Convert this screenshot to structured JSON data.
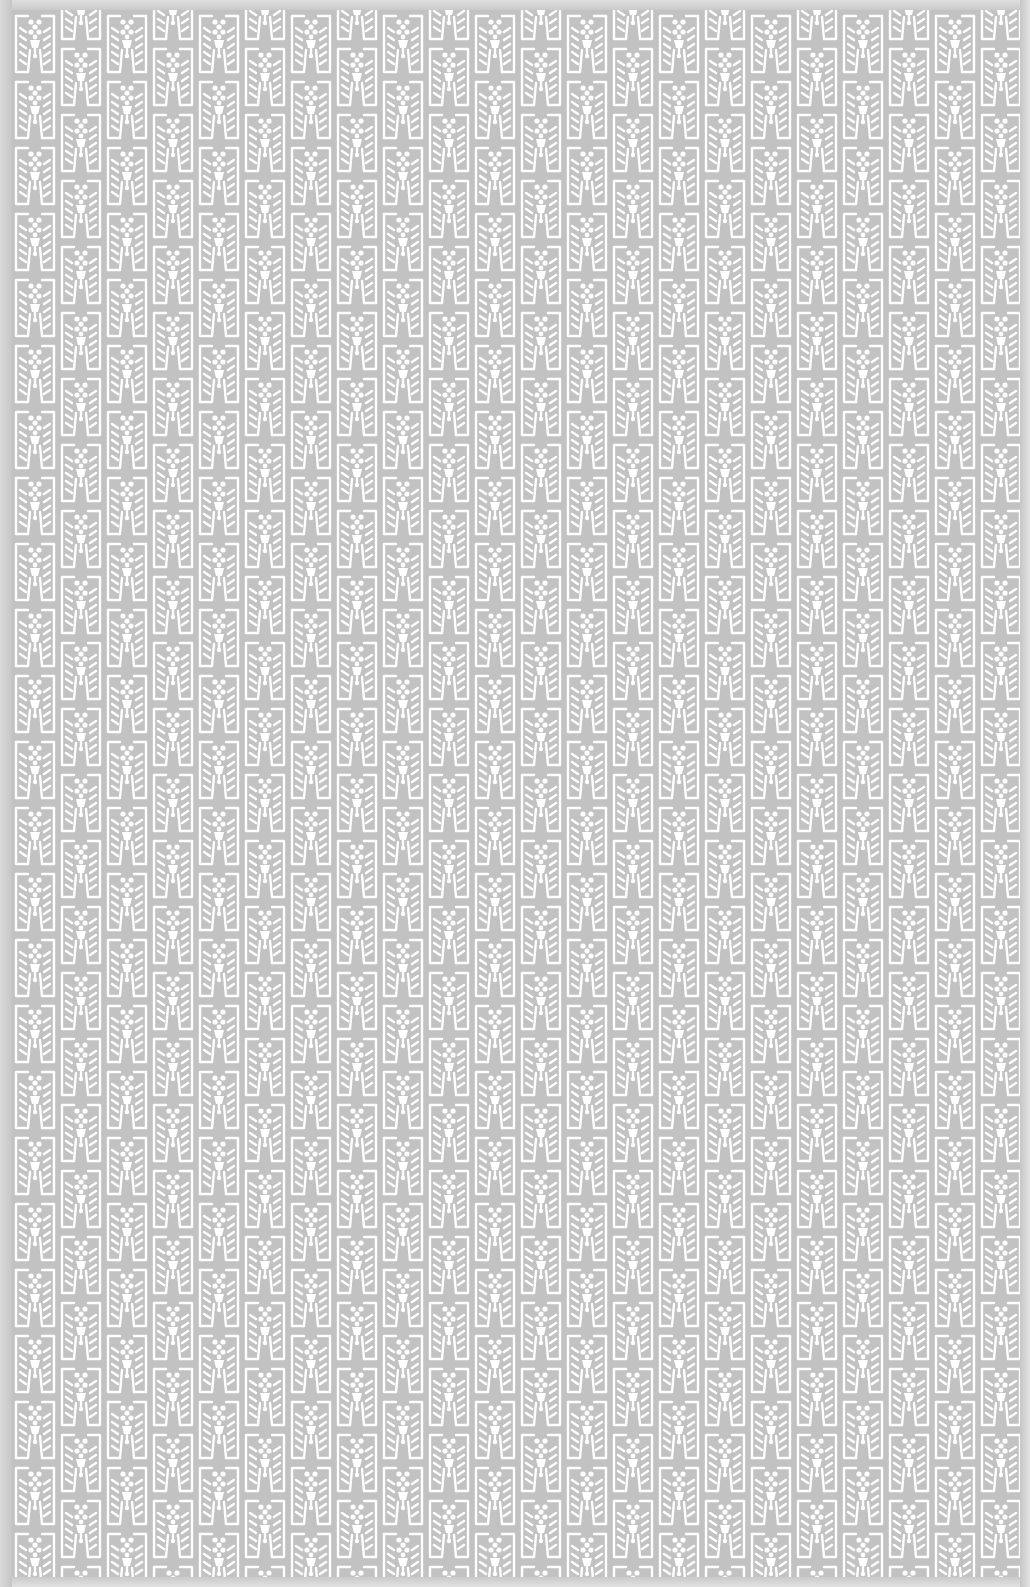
{
  "pattern": {
    "description": "Repeating white-on-grey block-print textile motif",
    "colors": {
      "background": "#c2c2c2",
      "motif": "#ffffff",
      "border": "#cfcfcf"
    },
    "tile": {
      "column_width": 46,
      "motif_height": 66,
      "column_offset": 33,
      "columns": 22,
      "rows": 25
    }
  }
}
